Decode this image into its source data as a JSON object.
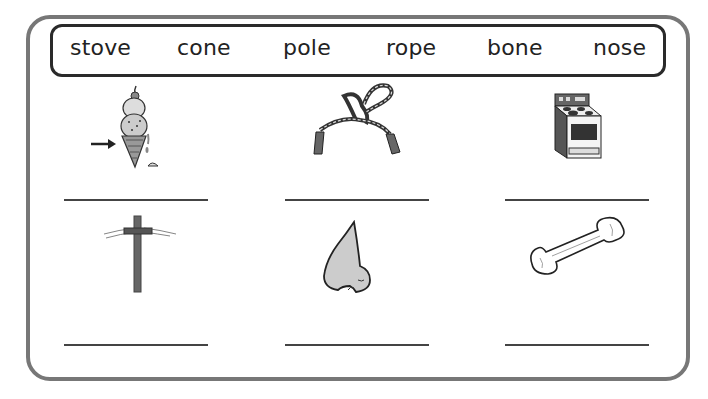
{
  "worksheet": {
    "word_bank": [
      "stove",
      "cone",
      "pole",
      "rope",
      "bone",
      "nose"
    ],
    "items": [
      {
        "picture": "ice-cream-cone",
        "answer": ""
      },
      {
        "picture": "jump-rope",
        "answer": ""
      },
      {
        "picture": "stove",
        "answer": ""
      },
      {
        "picture": "telephone-pole",
        "answer": ""
      },
      {
        "picture": "nose",
        "answer": ""
      },
      {
        "picture": "bone",
        "answer": ""
      }
    ],
    "colors": {
      "frame": "#777777",
      "word_box": "#2a2a2a",
      "line": "#444444"
    }
  }
}
